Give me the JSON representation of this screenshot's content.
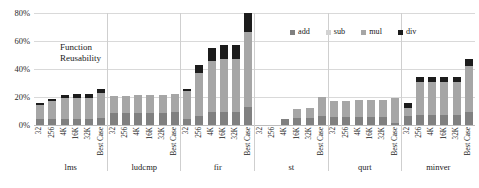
{
  "annotation": {
    "line1": "Function",
    "line2": "Reusability"
  },
  "legend": {
    "position": "top-right",
    "items": [
      {
        "label": "add",
        "color": "#808080",
        "icon": "square-swatch"
      },
      {
        "label": "sub",
        "color": "#d2d2d2",
        "icon": "square-swatch"
      },
      {
        "label": "mul",
        "color": "#a6a6a6",
        "icon": "square-swatch"
      },
      {
        "label": "div",
        "color": "#1c1c1c",
        "icon": "square-swatch"
      }
    ]
  },
  "axis": {
    "yticks": [
      "80%",
      "60%",
      "40%",
      "20%",
      "0%"
    ],
    "ymax": 80,
    "ymin": 0
  },
  "chart_data": {
    "type": "bar",
    "stacked": true,
    "title": "",
    "xlabel": "",
    "ylabel": "",
    "ylim": [
      0,
      80
    ],
    "ytick_values": [
      0,
      20,
      40,
      60,
      80
    ],
    "ytick_labels": [
      "0%",
      "20%",
      "40%",
      "60%",
      "80%"
    ],
    "grid": true,
    "annotation": "Function Reusability",
    "series_names": [
      "add",
      "sub",
      "mul",
      "div"
    ],
    "series_colors": [
      "#808080",
      "#d2d2d2",
      "#a6a6a6",
      "#1c1c1c"
    ],
    "subcategories": [
      "32",
      "256",
      "4K",
      "16K",
      "32K",
      "Best Case"
    ],
    "categories": [
      "lms",
      "ludcmp",
      "fir",
      "st",
      "qurt",
      "minver"
    ],
    "groups": [
      {
        "name": "lms",
        "bars": [
          {
            "label": "32",
            "add": 4.0,
            "sub": 0.0,
            "mul": 10.0,
            "div": 1.5,
            "total": 15.5
          },
          {
            "label": "256",
            "add": 4.5,
            "sub": 0.0,
            "mul": 12.5,
            "div": 1.5,
            "total": 18.5
          },
          {
            "label": "4K",
            "add": 4.5,
            "sub": 0.0,
            "mul": 14.5,
            "div": 2.5,
            "total": 21.5
          },
          {
            "label": "16K",
            "add": 4.5,
            "sub": 0.0,
            "mul": 15.0,
            "div": 2.5,
            "total": 22.0
          },
          {
            "label": "32K",
            "add": 4.5,
            "sub": 0.0,
            "mul": 15.0,
            "div": 2.5,
            "total": 22.0
          },
          {
            "label": "Best Case",
            "add": 5.0,
            "sub": 0.0,
            "mul": 18.0,
            "div": 3.0,
            "total": 26.0
          }
        ]
      },
      {
        "name": "ludcmp",
        "bars": [
          {
            "label": "32",
            "add": 8.5,
            "sub": 0.0,
            "mul": 12.0,
            "div": 0.0,
            "total": 20.5
          },
          {
            "label": "256",
            "add": 8.5,
            "sub": 0.0,
            "mul": 12.0,
            "div": 0.0,
            "total": 20.5
          },
          {
            "label": "4K",
            "add": 8.5,
            "sub": 0.0,
            "mul": 13.0,
            "div": 0.0,
            "total": 21.5
          },
          {
            "label": "16K",
            "add": 8.5,
            "sub": 0.0,
            "mul": 13.0,
            "div": 0.0,
            "total": 21.5
          },
          {
            "label": "32K",
            "add": 8.5,
            "sub": 0.0,
            "mul": 13.0,
            "div": 0.0,
            "total": 21.5
          },
          {
            "label": "Best Case",
            "add": 9.0,
            "sub": 0.0,
            "mul": 13.5,
            "div": 0.0,
            "total": 22.5
          }
        ]
      },
      {
        "name": "fir",
        "bars": [
          {
            "label": "32",
            "add": 4.0,
            "sub": 0.0,
            "mul": 20.0,
            "div": 1.5,
            "total": 25.5
          },
          {
            "label": "256",
            "add": 6.5,
            "sub": 0.0,
            "mul": 30.5,
            "div": 6.0,
            "total": 43.0
          },
          {
            "label": "4K",
            "add": 9.5,
            "sub": 0.0,
            "mul": 36.0,
            "div": 9.5,
            "total": 55.0
          },
          {
            "label": "16K",
            "add": 9.5,
            "sub": 0.0,
            "mul": 38.0,
            "div": 9.5,
            "total": 57.0
          },
          {
            "label": "32K",
            "add": 9.5,
            "sub": 0.0,
            "mul": 38.0,
            "div": 9.5,
            "total": 57.0
          },
          {
            "label": "Best Case",
            "add": 13.0,
            "sub": 0.0,
            "mul": 55.0,
            "div": 14.0,
            "total": 82.0
          }
        ]
      },
      {
        "name": "st",
        "bars": [
          {
            "label": "32",
            "add": 0.0,
            "sub": 0.0,
            "mul": 0.0,
            "div": 0.0,
            "total": 0.0
          },
          {
            "label": "256",
            "add": 0.0,
            "sub": 0.0,
            "mul": 0.0,
            "div": 0.0,
            "total": 0.0
          },
          {
            "label": "4K",
            "add": 4.5,
            "sub": 0.0,
            "mul": 0.0,
            "div": 0.0,
            "total": 4.5
          },
          {
            "label": "16K",
            "add": 5.0,
            "sub": 0.0,
            "mul": 6.5,
            "div": 0.0,
            "total": 11.5
          },
          {
            "label": "32K",
            "add": 5.0,
            "sub": 0.0,
            "mul": 7.5,
            "div": 0.0,
            "total": 12.5
          },
          {
            "label": "Best Case",
            "add": 6.5,
            "sub": 0.0,
            "mul": 13.5,
            "div": 0.0,
            "total": 20.0
          }
        ]
      },
      {
        "name": "qurt",
        "bars": [
          {
            "label": "32",
            "add": 5.5,
            "sub": 0.0,
            "mul": 11.5,
            "div": 0.0,
            "total": 17.0
          },
          {
            "label": "256",
            "add": 5.5,
            "sub": 0.0,
            "mul": 11.5,
            "div": 0.0,
            "total": 17.0
          },
          {
            "label": "4K",
            "add": 5.5,
            "sub": 0.0,
            "mul": 12.5,
            "div": 0.0,
            "total": 18.0
          },
          {
            "label": "16K",
            "add": 5.5,
            "sub": 0.0,
            "mul": 12.5,
            "div": 0.0,
            "total": 18.0
          },
          {
            "label": "32K",
            "add": 5.5,
            "sub": 0.0,
            "mul": 12.5,
            "div": 0.0,
            "total": 18.0
          },
          {
            "label": "Best Case",
            "add": 1.5,
            "sub": 0.0,
            "mul": 17.5,
            "div": 0.0,
            "total": 19.0
          }
        ]
      },
      {
        "name": "minver",
        "bars": [
          {
            "label": "32",
            "add": 6.5,
            "sub": 0.0,
            "mul": 5.5,
            "div": 3.5,
            "total": 15.5
          },
          {
            "label": "256",
            "add": 7.0,
            "sub": 0.0,
            "mul": 23.5,
            "div": 3.5,
            "total": 34.0
          },
          {
            "label": "4K",
            "add": 7.0,
            "sub": 0.0,
            "mul": 23.5,
            "div": 3.5,
            "total": 34.0
          },
          {
            "label": "16K",
            "add": 7.0,
            "sub": 0.0,
            "mul": 23.5,
            "div": 3.5,
            "total": 34.0
          },
          {
            "label": "32K",
            "add": 7.0,
            "sub": 0.0,
            "mul": 23.5,
            "div": 3.5,
            "total": 34.0
          },
          {
            "label": "Best Case",
            "add": 9.0,
            "sub": 0.0,
            "mul": 33.0,
            "div": 5.0,
            "total": 47.0
          }
        ]
      }
    ]
  }
}
